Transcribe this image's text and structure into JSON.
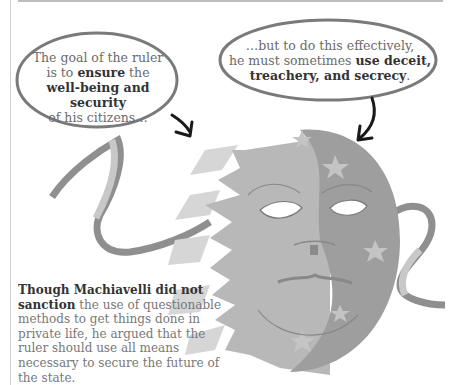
{
  "bubble_left": {
    "line1": "The goal of the ruler",
    "line2_pre": "is to ",
    "line2_bold": "ensure",
    "line2_post": " the",
    "line3_bold": "well-being and security",
    "line4": "of his citizens…"
  },
  "bubble_right": {
    "line1": "…but to do this effectively,",
    "line2_pre": "he must sometimes ",
    "line2_bold": "use deceit,",
    "line3_bold": "treachery, and secrecy",
    "line3_post": "."
  },
  "caption": {
    "bold": "Though Machiavelli did not sanction",
    "text": " the use of questionable methods to get things done in private life, he argued that the ruler should use all means necessary to secure the future of the state."
  },
  "illustration": {
    "subject": "sun-and-moon-mask",
    "colors": {
      "sun": "#b8b8b8",
      "sun_light": "#d6d6d6",
      "moon": "#9e9e9e",
      "star": "#c4c4c4",
      "ribbon_dark": "#8f8f8f",
      "ribbon_light": "#c8c8c8",
      "bubble_outline": "#7a7a7a",
      "arrow": "#1a1a1a"
    }
  }
}
